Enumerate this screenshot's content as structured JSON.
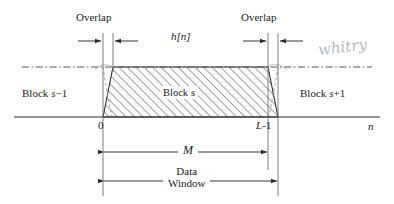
{
  "figure": {
    "axis_label": "n",
    "envelope_label": "h[n]"
  },
  "labels": {
    "overlap_left": "Overlap",
    "overlap_right": "Overlap",
    "block_prev": "Block s−1",
    "block_current": "Block s",
    "block_next": "Block s+1",
    "tick_zero": "0",
    "tick_end": "L-1",
    "dim_M": "M",
    "data_window_line1": "Data",
    "data_window_line2": "Window",
    "annotation_handwritten": "whitry"
  },
  "block_parts": {
    "prev_word": "Block",
    "prev_sym": "s",
    "prev_suffix": "−1",
    "cur_word": "Block",
    "cur_sym": "s",
    "next_word": "Block",
    "next_sym": "s",
    "next_suffix": "+1",
    "end_letter": "L",
    "end_suffix": "-1"
  },
  "colors": {
    "line": "#2b2b2b",
    "hatch": "#4a4a4a",
    "dashdot": "#555555",
    "taper_dashed": "#8a8a8a",
    "text": "#1a1a1a",
    "handwriting": "#9aa3ae",
    "background": "#ffffff"
  },
  "geometry": {
    "baseline_y": 117,
    "plateau_y": 67,
    "x_zero": 103,
    "x_inner_left": 113,
    "x_inner_right": 268,
    "x_outer_right": 278,
    "trapezoid_top_left": 113,
    "trapezoid_top_right": 268,
    "trapezoid_base_left": 103,
    "trapezoid_base_right": 278,
    "dashdot_x_start": 22,
    "dashdot_x_end": 372,
    "axis_x_start": 14,
    "axis_x_end": 380,
    "m_arrow_y": 152,
    "window_arrow_y": 181
  }
}
